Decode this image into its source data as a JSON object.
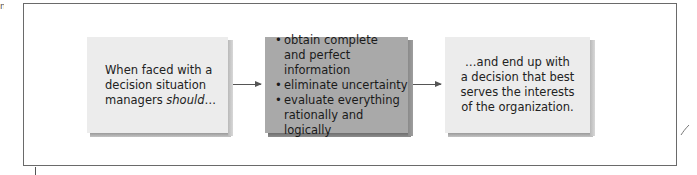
{
  "diagram": {
    "corner_fragment": "n",
    "boxes": [
      {
        "id": "start",
        "lines": [
          "When faced with a",
          "decision situation"
        ],
        "last_line_prefix": "managers ",
        "last_line_emphasis": "should",
        "last_line_suffix": "…",
        "fill": "#ececec"
      },
      {
        "id": "process",
        "bullet_glyph": "•",
        "bullets": [
          {
            "line1": "obtain complete",
            "line2": "and perfect information"
          },
          {
            "line1": "eliminate uncertainty",
            "line2": ""
          },
          {
            "line1": "evaluate everything",
            "line2": "rationally and logically"
          }
        ],
        "fill": "#a9a9a9"
      },
      {
        "id": "outcome",
        "lines": [
          "…and end up with",
          "a decision that best",
          "serves the interests",
          "of the organization."
        ],
        "fill": "#ececec"
      }
    ],
    "arrows": [
      {
        "from": "start",
        "to": "process"
      },
      {
        "from": "process",
        "to": "outcome"
      }
    ],
    "colors": {
      "frame_border": "#6a6a6a",
      "arrow": "#555555",
      "text": "#222222"
    }
  }
}
